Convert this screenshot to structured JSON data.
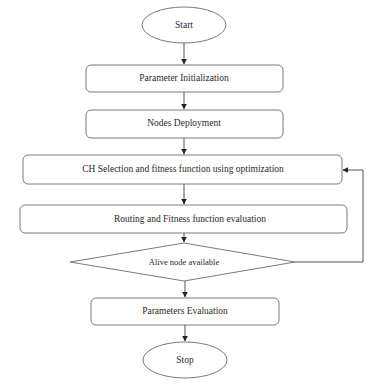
{
  "diagram": {
    "type": "flowchart",
    "nodes": [
      {
        "id": "start",
        "shape": "ellipse",
        "label": "Start"
      },
      {
        "id": "param_init",
        "shape": "rounded-rect",
        "label": "Parameter Initialization"
      },
      {
        "id": "nodes_deploy",
        "shape": "rounded-rect",
        "label": "Nodes Deployment"
      },
      {
        "id": "ch_selection",
        "shape": "rounded-rect",
        "label": "CH Selection and fitness function using optimization"
      },
      {
        "id": "routing",
        "shape": "rounded-rect",
        "label": "Routing and Fitness function evaluation"
      },
      {
        "id": "alive_check",
        "shape": "diamond",
        "label": "Alive node available"
      },
      {
        "id": "params_eval",
        "shape": "rounded-rect",
        "label": "Parameters Evaluation"
      },
      {
        "id": "stop",
        "shape": "ellipse",
        "label": "Stop"
      }
    ],
    "edges": [
      {
        "from": "start",
        "to": "param_init"
      },
      {
        "from": "param_init",
        "to": "nodes_deploy"
      },
      {
        "from": "nodes_deploy",
        "to": "ch_selection"
      },
      {
        "from": "ch_selection",
        "to": "routing"
      },
      {
        "from": "routing",
        "to": "alive_check"
      },
      {
        "from": "alive_check",
        "to": "ch_selection",
        "type": "feedback-loop"
      },
      {
        "from": "alive_check",
        "to": "params_eval"
      },
      {
        "from": "params_eval",
        "to": "stop"
      }
    ]
  },
  "labels": {
    "start": "Start",
    "param_init": "Parameter Initialization",
    "nodes_deploy": "Nodes Deployment",
    "ch_selection": "CH Selection and fitness function using optimization",
    "routing": "Routing and Fitness function evaluation",
    "alive_check": "Alive node available",
    "params_eval": "Parameters Evaluation",
    "stop": "Stop"
  },
  "colors": {
    "stroke": "#7a7a7a",
    "arrow": "#222222",
    "text": "#2a2a2a",
    "background": "#ffffff"
  }
}
